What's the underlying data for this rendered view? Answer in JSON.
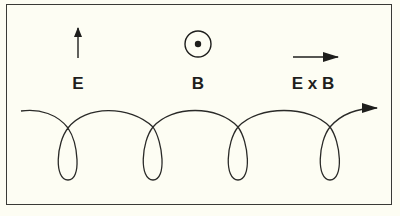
{
  "figure": {
    "colors": {
      "background": "#fdfdf3",
      "ink": "#1e1e1c",
      "frame": "#3a3a36"
    }
  },
  "legend": {
    "e_field": {
      "label": "E",
      "symbol": "arrow-up"
    },
    "b_field": {
      "label": "B",
      "symbol": "circle-dot (out of page)"
    },
    "drift": {
      "label": "E x B",
      "symbol": "arrow-right"
    }
  },
  "trajectory": {
    "shape": "trochoid / cycloidal loops",
    "loop_count": 4,
    "direction": "left-to-right with arrowhead at end"
  }
}
